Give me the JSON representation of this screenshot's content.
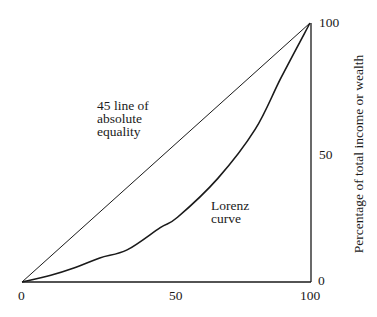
{
  "chart_data": {
    "type": "line",
    "title": "",
    "xlabel": "",
    "ylabel": "Percentage of total income or wealth",
    "xlim": [
      0,
      100
    ],
    "ylim": [
      0,
      100
    ],
    "grid": false,
    "legend": null,
    "x_ticks": [
      "0",
      "50",
      "100"
    ],
    "y_ticks": [
      "0",
      "50",
      "100"
    ],
    "y_axis_position": "right",
    "series": [
      {
        "name": "45 line of absolute equality",
        "x": [
          0,
          100
        ],
        "y": [
          0,
          100
        ]
      },
      {
        "name": "Lorenz curve",
        "x": [
          0,
          10,
          18,
          27,
          36.5,
          48,
          54,
          68,
          81,
          90,
          100
        ],
        "y": [
          0,
          2.6,
          5.4,
          9.3,
          12.4,
          21,
          25,
          40,
          59,
          79,
          100
        ]
      }
    ],
    "annotations": [
      {
        "text": [
          "45 line of",
          "absolute",
          "equality"
        ],
        "x": 26,
        "y": 68
      },
      {
        "text": [
          "Lorenz",
          "curve"
        ],
        "x": 66,
        "y": 27
      }
    ]
  },
  "labels": {
    "equality": [
      "45 line of",
      "absolute",
      "equality"
    ],
    "lorenz": [
      "Lorenz",
      "curve"
    ],
    "ylabel": "Percentage of total income or wealth",
    "x_ticks": [
      "0",
      "50",
      "100"
    ],
    "y_ticks": [
      "100",
      "50",
      "0"
    ]
  },
  "colors": {
    "line": "#1a1a1a",
    "background": "#ffffff"
  }
}
